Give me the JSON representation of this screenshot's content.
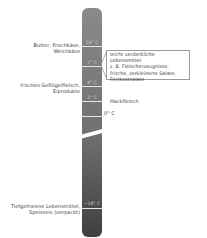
{
  "diagram": {
    "type": "thermometer",
    "colors": {
      "bar_top": "#8a8a8a",
      "bar_bottom": "#3f3f3f",
      "tick": "#e6e6e6",
      "text": "#444444"
    },
    "ticks": [
      {
        "temp": "10° C",
        "y": 46
      },
      {
        "temp": "7° C",
        "y": 66
      },
      {
        "temp": "4° C",
        "y": 86
      },
      {
        "temp": "2° C",
        "y": 101
      },
      {
        "temp": "0° C",
        "y": 116
      },
      {
        "temp": "−18° C",
        "y": 208
      }
    ],
    "left_labels": [
      {
        "lines": [
          "Butter, Frischkäse,",
          "Weichkäse"
        ]
      },
      {
        "lines": [
          "frisches Geflügelfleisch,",
          "Eiprodukte"
        ]
      },
      {
        "lines": [
          "Tiefgefrorene Lebensmittel,",
          "Speiseeis (verpackt)"
        ]
      }
    ],
    "right_labels": {
      "callout": [
        "leicht verderbliche Lebensmittel",
        "z. B. Fleischerzeugnisse,",
        "frische, zerkleinerte Salate,",
        "Feinkostsalate"
      ],
      "hackfleisch": "Hackfleisch",
      "zero": "0° C"
    }
  }
}
